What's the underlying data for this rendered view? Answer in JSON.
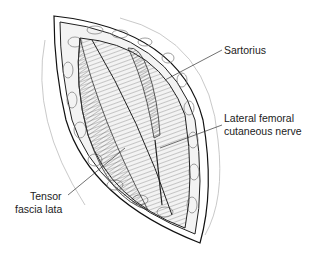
{
  "figure": {
    "labels": {
      "sartorius": "Sartorius",
      "lfcn_line1": "Lateral femoral",
      "lfcn_line2": "cutaneous nerve",
      "tfl_line1": "Tensor",
      "tfl_line2": "fascia lata"
    }
  }
}
